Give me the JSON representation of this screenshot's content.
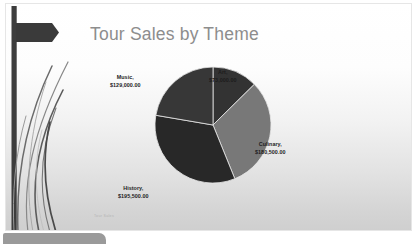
{
  "slide": {
    "title": "Tour Sales by Theme",
    "footnote": "Tour Sales"
  },
  "chart_data": {
    "type": "pie",
    "title": "Tour Sales by Theme",
    "xlabel": "",
    "ylabel": "",
    "legend_position": "none",
    "grid": false,
    "label_format": "{name}, {value}",
    "categories": [
      "Art",
      "Culinary",
      "History",
      "Music"
    ],
    "values": [
      73000,
      180500,
      195500,
      129000
    ],
    "value_labels": [
      "$73,000.00",
      "$180,500.00",
      "$195,500.00",
      "$129,000.00"
    ],
    "total": 578000,
    "start_angle_deg": 0,
    "direction": "clockwise",
    "slices": [
      {
        "name": "Art",
        "value": 73000,
        "value_label": "$73,000.00",
        "label": "Art,",
        "percent": 12.6,
        "angle_deg": 45.5,
        "color": "#333333"
      },
      {
        "name": "Culinary",
        "value": 180500,
        "value_label": "$180,500.00",
        "label": "Culinary,",
        "percent": 31.2,
        "angle_deg": 112.4,
        "color": "#787878"
      },
      {
        "name": "History",
        "value": 195500,
        "value_label": "$195,500.00",
        "label": "History,",
        "percent": 33.8,
        "angle_deg": 121.7,
        "color": "#282828"
      },
      {
        "name": "Music",
        "value": 129000,
        "value_label": "$129,000.00",
        "label": "Music,",
        "percent": 22.3,
        "angle_deg": 80.3,
        "color": "#373737"
      }
    ]
  },
  "colors": {
    "title_text": "#8d8d8d",
    "label_text": "#1c1c1c",
    "slide_background_top": "#ffffff",
    "slide_background_bottom": "#cfcfcf",
    "decor_dark": "#3a3a3a",
    "bottom_tab": "#9a9a9a"
  }
}
